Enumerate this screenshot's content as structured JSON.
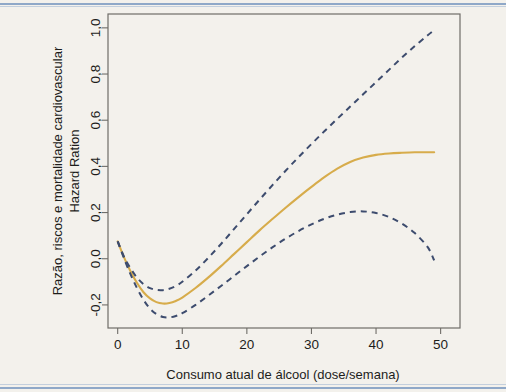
{
  "figure": {
    "background_color": "#f3f1ec",
    "rule_color": "#8fa8c8",
    "plot_frame_color": "#6f6d68"
  },
  "chart_data": {
    "type": "line",
    "title": "",
    "subtitle": "",
    "xlabel": "Consumo atual de álcool (dose/semana)",
    "ylabel_line1": "Razão, riscos e mortalidade cardiovascular",
    "ylabel_line2": "Hazard Ration",
    "xlim": [
      -1.5,
      53
    ],
    "ylim": [
      -0.3,
      1.06
    ],
    "xticks": [
      0,
      10,
      20,
      30,
      40,
      50
    ],
    "xticklabels": [
      "0",
      "10",
      "20",
      "30",
      "40",
      "50"
    ],
    "yticks": [
      -0.2,
      0.0,
      0.2,
      0.4,
      0.6,
      0.8,
      1.0
    ],
    "yticklabels": [
      "-0,2",
      "0,0",
      "0,2",
      "0,4",
      "0,6",
      "0,8",
      "1,0"
    ],
    "grid": false,
    "legend": "none",
    "series": [
      {
        "name": "Hazard ratio (estimativa pontual)",
        "style": "solid",
        "color": "#d7ac4b",
        "x": [
          0,
          1,
          2,
          3,
          4,
          5,
          6,
          7,
          8,
          9,
          10,
          12,
          14,
          16,
          18,
          20,
          22,
          24,
          26,
          28,
          30,
          32,
          34,
          36,
          38,
          40,
          42,
          44,
          46,
          48,
          49
        ],
        "y": [
          0.075,
          0.005,
          -0.055,
          -0.105,
          -0.145,
          -0.172,
          -0.188,
          -0.194,
          -0.192,
          -0.183,
          -0.168,
          -0.128,
          -0.082,
          -0.032,
          0.02,
          0.072,
          0.124,
          0.173,
          0.221,
          0.267,
          0.311,
          0.353,
          0.39,
          0.419,
          0.438,
          0.45,
          0.456,
          0.459,
          0.461,
          0.461,
          0.461
        ]
      },
      {
        "name": "Limite superior do intervalo de confiança",
        "style": "dashed",
        "color": "#3d4c6e",
        "x": [
          0,
          1,
          2,
          3,
          4,
          5,
          6,
          7,
          8,
          9,
          10,
          12,
          14,
          16,
          18,
          20,
          22,
          24,
          26,
          28,
          30,
          32,
          34,
          36,
          38,
          40,
          42,
          44,
          46,
          48,
          49
        ],
        "y": [
          0.075,
          0.008,
          -0.042,
          -0.082,
          -0.11,
          -0.127,
          -0.135,
          -0.136,
          -0.13,
          -0.118,
          -0.1,
          -0.053,
          0.003,
          0.064,
          0.128,
          0.193,
          0.257,
          0.32,
          0.381,
          0.44,
          0.497,
          0.552,
          0.606,
          0.659,
          0.712,
          0.765,
          0.818,
          0.871,
          0.921,
          0.968,
          0.99
        ]
      },
      {
        "name": "Limite inferior do intervalo de confiança",
        "style": "dashed",
        "color": "#3d4c6e",
        "x": [
          0,
          1,
          2,
          3,
          4,
          5,
          6,
          7,
          8,
          9,
          10,
          12,
          14,
          16,
          18,
          20,
          22,
          24,
          26,
          28,
          30,
          32,
          34,
          36,
          38,
          40,
          42,
          44,
          46,
          48,
          49
        ],
        "y": [
          0.075,
          0.0,
          -0.068,
          -0.128,
          -0.178,
          -0.216,
          -0.24,
          -0.252,
          -0.254,
          -0.248,
          -0.236,
          -0.201,
          -0.16,
          -0.118,
          -0.075,
          -0.032,
          0.01,
          0.05,
          0.087,
          0.12,
          0.149,
          0.173,
          0.191,
          0.202,
          0.205,
          0.198,
          0.181,
          0.152,
          0.111,
          0.05,
          -0.007
        ]
      }
    ],
    "annotations": []
  }
}
